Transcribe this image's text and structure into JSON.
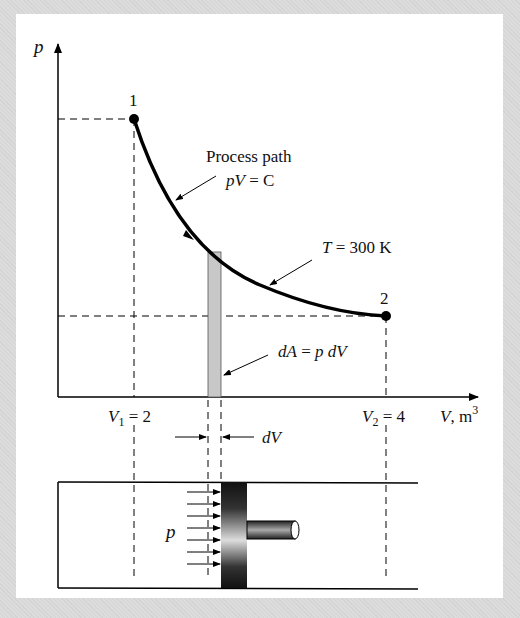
{
  "diagram": {
    "axes": {
      "y_label": "p",
      "x_label_var": "V",
      "x_label_unit": ", m",
      "x_label_exp": "3"
    },
    "points": [
      {
        "label": "1",
        "V": 2
      },
      {
        "label": "2",
        "V": 4
      }
    ],
    "v1_label": {
      "var": "V",
      "sub": "1",
      "rest": " = 2"
    },
    "v2_label": {
      "var": "V",
      "sub": "2",
      "rest": " = 4"
    },
    "annotations": {
      "process_path": "Process path",
      "pv_eq": {
        "var": "pV",
        "rest": " = C"
      },
      "temperature": {
        "var": "T",
        "rest": " = 300 K"
      },
      "da": {
        "var": "dA",
        "mid": " = ",
        "var2": "p dV"
      },
      "dv": "dV",
      "piston_p": "p"
    },
    "colors": {
      "curve": "#000000",
      "strip": "#c8c8c8",
      "background": "#d9d9d9",
      "panel": "#ffffff"
    }
  }
}
